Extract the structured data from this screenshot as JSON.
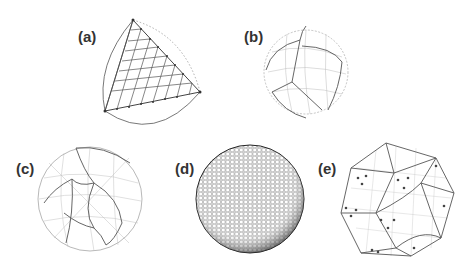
{
  "figure": {
    "panels": [
      {
        "id": "a",
        "label": "(a)",
        "description": "single spherical triangle subdivided with grid nodes"
      },
      {
        "id": "b",
        "label": "(b)",
        "description": "sphere with cube-like patch partition and coarse grid"
      },
      {
        "id": "c",
        "label": "(c)",
        "description": "sphere with quadrilateral patch partition and grid"
      },
      {
        "id": "d",
        "label": "(d)",
        "description": "fine hexagonal mesh on sphere"
      },
      {
        "id": "e",
        "label": "(e)",
        "description": "polyhedral patch layout with marked nodes"
      }
    ]
  },
  "colors": {
    "line": "#555555",
    "light_line": "#aaaaaa",
    "dotted": "#999999"
  }
}
